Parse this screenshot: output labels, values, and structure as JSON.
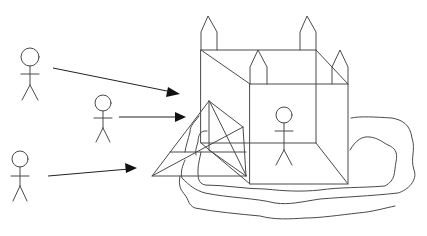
{
  "diagram": {
    "title_cropped": "",
    "colors": {
      "background": "#ffffff",
      "line": "#4a4a4a",
      "arrowhead": "#111111"
    },
    "figures": [
      {
        "id": "figure-left-top",
        "head": [
          30,
          57
        ],
        "head_r": 9
      },
      {
        "id": "figure-middle",
        "head": [
          103,
          103
        ],
        "head_r": 8
      },
      {
        "id": "figure-left-bottom",
        "head": [
          20,
          159
        ],
        "head_r": 8
      },
      {
        "id": "figure-inside-castle",
        "head": [
          284,
          115
        ],
        "head_r": 8
      }
    ],
    "arrows": [
      {
        "id": "arrow-top",
        "from": [
          53,
          68
        ],
        "to": [
          178,
          93
        ]
      },
      {
        "id": "arrow-middle",
        "from": [
          119,
          117
        ],
        "to": [
          184,
          117
        ]
      },
      {
        "id": "arrow-bottom",
        "from": [
          48,
          176
        ],
        "to": [
          135,
          168
        ]
      }
    ],
    "castle": {
      "back_box": {
        "x1": 201,
        "y1": 50,
        "x2": 316,
        "y2": 143
      },
      "front_box": {
        "x1": 250,
        "y1": 84,
        "x2": 348,
        "y2": 184
      },
      "towers": [
        {
          "id": "tower-back-left",
          "left": 201,
          "right": 217,
          "tip_y": 16,
          "shoulder_y": 32,
          "base_y": 50
        },
        {
          "id": "tower-back-right",
          "left": 300,
          "right": 316,
          "tip_y": 16,
          "shoulder_y": 32,
          "base_y": 50
        },
        {
          "id": "tower-front-left",
          "left": 250,
          "right": 267,
          "tip_y": 50,
          "shoulder_y": 67,
          "base_y": 84
        },
        {
          "id": "tower-front-right",
          "left": 332,
          "right": 348,
          "tip_y": 50,
          "shoulder_y": 67,
          "base_y": 84
        }
      ],
      "wedge": {
        "apex": [
          209,
          101
        ],
        "left": [
          152,
          176
        ],
        "right": [
          246,
          176
        ],
        "back_right": [
          243,
          127
        ]
      }
    }
  }
}
